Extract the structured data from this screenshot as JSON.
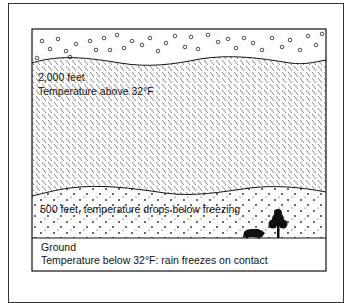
{
  "diagram": {
    "type": "freezing-rain-atmosphere-cross-section",
    "layers": [
      {
        "id": "cloud",
        "pattern": "circles",
        "description": "precipitation-cloud"
      },
      {
        "id": "warm",
        "pattern": "hatch",
        "label_lines": [
          "2,000 feet",
          "Temperature above 32°F"
        ]
      },
      {
        "id": "cold",
        "pattern": "dots",
        "label_lines": [
          "500 feet, temperature drops below freezing"
        ]
      },
      {
        "id": "ground",
        "pattern": "none",
        "label_lines": [
          "Ground",
          "Temperature below 32°F: rain freezes on contact"
        ]
      }
    ],
    "icons": [
      "tree-icon",
      "car-icon"
    ],
    "colors": {
      "ink": "#111111",
      "background": "#ffffff"
    }
  }
}
